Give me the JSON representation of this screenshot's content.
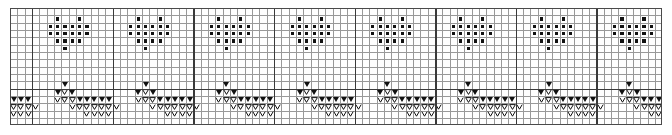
{
  "chart_data": {
    "type": "table",
    "title": "",
    "xlabel": "",
    "ylabel": "",
    "grid": true,
    "legend": "none",
    "columns": 89,
    "rows": 16,
    "cell_px": 7.33,
    "origin": {
      "x": 10,
      "y": 8
    },
    "repeat_width_columns": 11,
    "heavy_vline_columns": [
      11,
      22,
      33,
      44,
      55,
      66,
      77,
      88
    ],
    "heavy_hline_rows": [
      11
    ],
    "symbols": {
      "dot": "bobble-dot",
      "tri": "filled-triangle-decrease",
      "tri_open": "open-triangle-decrease",
      "vee": "vee-stitch"
    },
    "colors": {
      "symbol": "#111111",
      "gridline": "#5a5a5a",
      "heavyline": "#3a3a3a",
      "background": "#ffffff"
    },
    "motif_dot_offsets": [
      {
        "row": 1,
        "cols": [
          3,
          6
        ]
      },
      {
        "row": 2,
        "cols": [
          2,
          3,
          4,
          5,
          6,
          7
        ]
      },
      {
        "row": 3,
        "cols": [
          2,
          3,
          4,
          5,
          6,
          7
        ]
      },
      {
        "row": 4,
        "cols": [
          3,
          4,
          5,
          6
        ]
      },
      {
        "row": 5,
        "cols": [
          4
        ]
      }
    ],
    "motif_tri_offsets": [
      {
        "row": 10,
        "kind": "tri",
        "cols": [
          4
        ]
      },
      {
        "row": 11,
        "kind": "tri",
        "cols": [
          3,
          5
        ]
      },
      {
        "row": 11,
        "kind": "tri_open",
        "cols": [
          4
        ]
      },
      {
        "row": 12,
        "kind": "tri",
        "cols": [
          6,
          7,
          8,
          9,
          10
        ]
      },
      {
        "row": 12,
        "kind": "tri_open",
        "cols": [
          4,
          5
        ]
      },
      {
        "row": 12,
        "kind": "vee",
        "cols": [
          3
        ]
      },
      {
        "row": 13,
        "kind": "tri_open",
        "cols": [
          6,
          7,
          8,
          9,
          10
        ]
      },
      {
        "row": 13,
        "kind": "vee",
        "cols": [
          5,
          11
        ]
      },
      {
        "row": 14,
        "kind": "vee",
        "cols": [
          7,
          8,
          9,
          10
        ]
      }
    ]
  }
}
